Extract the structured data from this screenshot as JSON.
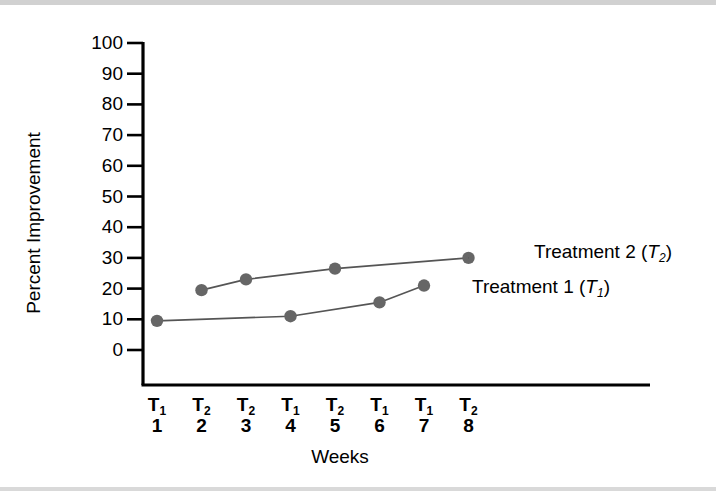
{
  "figure": {
    "background_color": "#ffffff",
    "band_color": "#c9c9c9",
    "axis_color": "#000000",
    "marker_color": "#666666",
    "line_color": "#555555"
  },
  "chart_data": {
    "type": "line",
    "title": "",
    "xlabel": "Weeks",
    "ylabel": "Percent Improvement",
    "ylim": [
      0,
      100
    ],
    "yticks": [
      0,
      10,
      20,
      30,
      40,
      50,
      60,
      70,
      80,
      90,
      100
    ],
    "ytick_labels": [
      "0",
      "10",
      "20",
      "30",
      "40",
      "50",
      "60",
      "70",
      "80",
      "90",
      "100"
    ],
    "x": [
      1,
      2,
      3,
      4,
      5,
      6,
      7,
      8
    ],
    "xtick_weeks": [
      "1",
      "2",
      "3",
      "4",
      "5",
      "6",
      "7",
      "8"
    ],
    "xtick_treatments": [
      "T1",
      "T2",
      "T2",
      "T1",
      "T2",
      "T1",
      "T1",
      "T2"
    ],
    "xtick_treatment_base": [
      "T",
      "T",
      "T",
      "T",
      "T",
      "T",
      "T",
      "T"
    ],
    "xtick_treatment_sub": [
      "1",
      "2",
      "2",
      "1",
      "2",
      "1",
      "1",
      "2"
    ],
    "grid": false,
    "legend_position": "right-inline",
    "series": [
      {
        "name": "Treatment 1 (T1)",
        "label_text": "Treatment 1 (",
        "label_symbol": "T",
        "label_sub": "1",
        "label_tail": ")",
        "points": [
          {
            "week": 1,
            "value": 9.5
          },
          {
            "week": 4,
            "value": 11.0
          },
          {
            "week": 6,
            "value": 15.5
          },
          {
            "week": 7,
            "value": 21.0
          }
        ]
      },
      {
        "name": "Treatment 2 (T2)",
        "label_text": "Treatment 2 (",
        "label_symbol": "T",
        "label_sub": "2",
        "label_tail": ")",
        "points": [
          {
            "week": 2,
            "value": 19.5
          },
          {
            "week": 3,
            "value": 23.0
          },
          {
            "week": 5,
            "value": 26.5
          },
          {
            "week": 8,
            "value": 30.0
          }
        ]
      }
    ]
  }
}
